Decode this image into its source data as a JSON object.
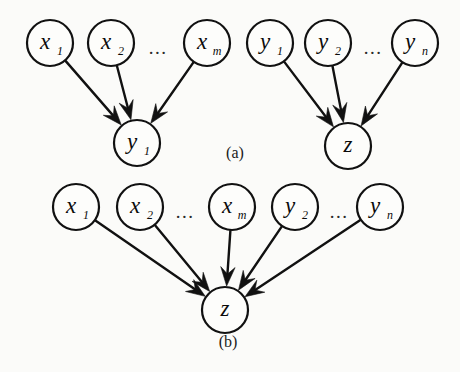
{
  "figure": {
    "background_color": "#fbfbf9",
    "ink_color": "#111111",
    "width": 460,
    "height": 372
  },
  "panels": [
    {
      "id": "panel-a",
      "label": "(a)",
      "label_x": 235,
      "label_y": 154,
      "description": "Two separate converging structures: x-parents into y1, y-parents into z"
    },
    {
      "id": "panel-b",
      "label": "(b)",
      "label_x": 228,
      "label_y": 343,
      "description": "All parents converge into a single z node"
    }
  ],
  "graph_data": {
    "type": "directed-acyclic-graph",
    "panel_a": {
      "nodes": [
        {
          "id": "a-x1",
          "base": "x",
          "sub": "1",
          "cx": 50,
          "cy": 43,
          "r": 23
        },
        {
          "id": "a-x2",
          "base": "x",
          "sub": "2",
          "cx": 111,
          "cy": 43,
          "r": 23
        },
        {
          "id": "a-xm",
          "base": "x",
          "sub": "m",
          "cx": 207,
          "cy": 43,
          "r": 23
        },
        {
          "id": "a-y1",
          "base": "y",
          "sub": "1",
          "cx": 270,
          "cy": 43,
          "r": 23
        },
        {
          "id": "a-y2",
          "base": "y",
          "sub": "2",
          "cx": 328,
          "cy": 43,
          "r": 23
        },
        {
          "id": "a-yn",
          "base": "y",
          "sub": "n",
          "cx": 415,
          "cy": 43,
          "r": 23
        },
        {
          "id": "a-target-y1",
          "base": "y",
          "sub": "1",
          "cx": 137,
          "cy": 143,
          "r": 23
        },
        {
          "id": "a-target-z",
          "base": "z",
          "sub": "",
          "cx": 348,
          "cy": 146,
          "r": 23
        }
      ],
      "ellipses": [
        {
          "id": "a-ell-x",
          "text": "...",
          "x": 158,
          "y": 50
        },
        {
          "id": "a-ell-y",
          "text": "...",
          "x": 373,
          "y": 50
        }
      ],
      "edges": [
        {
          "from": "a-x1",
          "to": "a-target-y1"
        },
        {
          "from": "a-x2",
          "to": "a-target-y1"
        },
        {
          "from": "a-xm",
          "to": "a-target-y1"
        },
        {
          "from": "a-y1",
          "to": "a-target-z"
        },
        {
          "from": "a-y2",
          "to": "a-target-z"
        },
        {
          "from": "a-yn",
          "to": "a-target-z"
        }
      ]
    },
    "panel_b": {
      "nodes": [
        {
          "id": "b-x1",
          "base": "x",
          "sub": "1",
          "cx": 76,
          "cy": 207,
          "r": 23
        },
        {
          "id": "b-x2",
          "base": "x",
          "sub": "2",
          "cx": 140,
          "cy": 207,
          "r": 23
        },
        {
          "id": "b-xm",
          "base": "x",
          "sub": "m",
          "cx": 232,
          "cy": 207,
          "r": 23
        },
        {
          "id": "b-y2",
          "base": "y",
          "sub": "2",
          "cx": 295,
          "cy": 207,
          "r": 23
        },
        {
          "id": "b-yn",
          "base": "y",
          "sub": "n",
          "cx": 380,
          "cy": 207,
          "r": 23
        },
        {
          "id": "b-target-z",
          "base": "z",
          "sub": "",
          "cx": 225,
          "cy": 310,
          "r": 23
        }
      ],
      "ellipses": [
        {
          "id": "b-ell-x",
          "text": "...",
          "x": 185,
          "y": 214
        },
        {
          "id": "b-ell-y",
          "text": "...",
          "x": 339,
          "y": 214
        }
      ],
      "edges": [
        {
          "from": "b-x1",
          "to": "b-target-z"
        },
        {
          "from": "b-x2",
          "to": "b-target-z"
        },
        {
          "from": "b-xm",
          "to": "b-target-z"
        },
        {
          "from": "b-y2",
          "to": "b-target-z"
        },
        {
          "from": "b-yn",
          "to": "b-target-z"
        }
      ]
    }
  }
}
